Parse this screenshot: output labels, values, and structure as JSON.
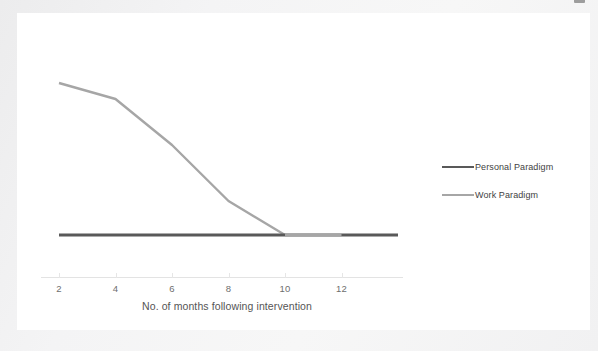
{
  "chart_data": {
    "type": "line",
    "title": "",
    "xlabel": "No. of months following intervention",
    "ylabel": "",
    "xticks": [
      2,
      4,
      6,
      8,
      10,
      12
    ],
    "xlim": [
      1,
      14
    ],
    "ylim": [
      0,
      10
    ],
    "grid": false,
    "legend_position": "right",
    "series": [
      {
        "name": "Personal Paradigm",
        "color": "#595959",
        "x": [
          2,
          4,
          6,
          8,
          10,
          12,
          14
        ],
        "values": [
          1,
          1,
          1,
          1,
          1,
          1,
          1
        ]
      },
      {
        "name": "Work Paradigm",
        "color": "#a6a6a6",
        "x": [
          2,
          4,
          6,
          8,
          10,
          12,
          14
        ],
        "values": [
          8.6,
          7.8,
          5.5,
          2.7,
          1.0,
          1.0,
          1.0
        ]
      }
    ]
  },
  "axis": {
    "tick_labels": [
      "2",
      "4",
      "6",
      "8",
      "10",
      "12"
    ],
    "title": "No. of months following intervention"
  },
  "legend": {
    "items": [
      {
        "label": "Personal Paradigm",
        "color": "#595959"
      },
      {
        "label": "Work Paradigm",
        "color": "#a6a6a6"
      }
    ]
  },
  "colors": {
    "page_background": "#f2f2f2",
    "card_background": "#ffffff",
    "personal_paradigm": "#595959",
    "work_paradigm": "#a6a6a6",
    "axis_line": "#e3e3e3",
    "tick_text": "#6e6e6e",
    "axis_title_text": "#555555",
    "legend_text": "#3f3f3f"
  }
}
